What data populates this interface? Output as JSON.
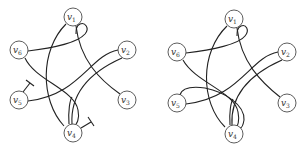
{
  "diagrams": [
    {
      "id": "left",
      "nodes": [
        {
          "label": "v",
          "sub": "1",
          "x": 73,
          "y": 17
        },
        {
          "label": "v",
          "sub": "2",
          "x": 127,
          "y": 50
        },
        {
          "label": "v",
          "sub": "3",
          "x": 127,
          "y": 100
        },
        {
          "label": "v",
          "sub": "4",
          "x": 73,
          "y": 133
        },
        {
          "label": "v",
          "sub": "5",
          "x": 19,
          "y": 100
        },
        {
          "label": "v",
          "sub": "6",
          "x": 19,
          "y": 50
        }
      ],
      "edges": [
        "v6-v1 (loop around v1 right side)",
        "v1-v4 (left arc)",
        "v1-v3",
        "v2-v5",
        "v2-v4",
        "v6-v4",
        "v4-v4 (double strand)"
      ],
      "half_edges": [
        "v5 stub (T-end)",
        "v4 stub (T-end)"
      ]
    },
    {
      "id": "right",
      "nodes": [
        {
          "label": "v",
          "sub": "1",
          "x": 234,
          "y": 19
        },
        {
          "label": "v",
          "sub": "2",
          "x": 287,
          "y": 52
        },
        {
          "label": "v",
          "sub": "3",
          "x": 287,
          "y": 103
        },
        {
          "label": "v",
          "sub": "4",
          "x": 234,
          "y": 134
        },
        {
          "label": "v",
          "sub": "5",
          "x": 177,
          "y": 103
        },
        {
          "label": "v",
          "sub": "6",
          "x": 177,
          "y": 52
        }
      ],
      "edges": [
        "v6-v1 (loop around v1 right side)",
        "v1-v4 (left arc)",
        "v1-v3",
        "v2-v5",
        "v2-v4",
        "v6-v4",
        "v5-v4 (joined half-edges, looping)",
        "v4-v4 (double strand)"
      ]
    }
  ]
}
